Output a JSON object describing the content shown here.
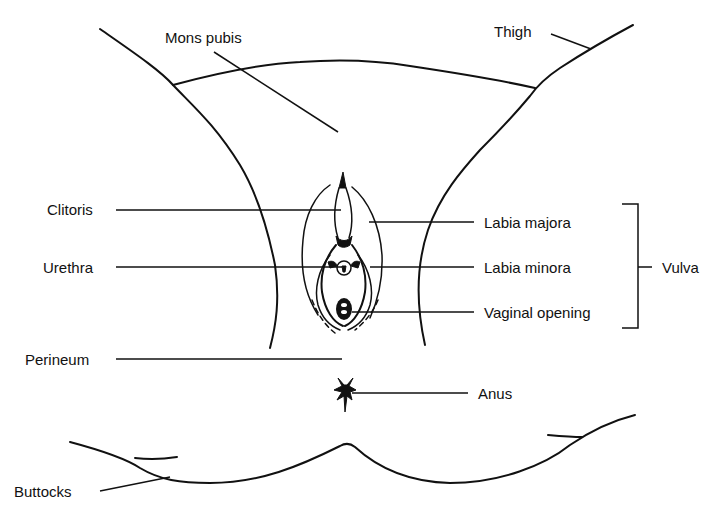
{
  "diagram": {
    "type": "labeled anatomical line drawing",
    "labels": {
      "mons_pubis": "Mons pubis",
      "thigh": "Thigh",
      "clitoris": "Clitoris",
      "urethra": "Urethra",
      "perineum": "Perineum",
      "labia_majora": "Labia majora",
      "labia_minora": "Labia minora",
      "vaginal_opening": "Vaginal opening",
      "vulva": "Vulva",
      "anus": "Anus",
      "buttocks": "Buttocks"
    },
    "groups": [
      {
        "name": "Vulva",
        "members": [
          "Labia majora",
          "Labia minora",
          "Vaginal opening"
        ]
      }
    ],
    "colors": {
      "ink": "#111111",
      "background": "#ffffff"
    }
  }
}
